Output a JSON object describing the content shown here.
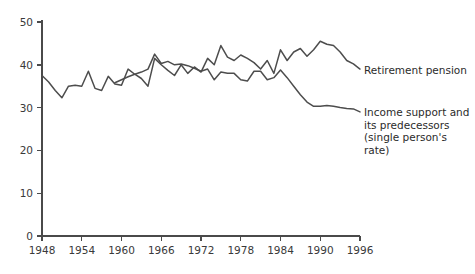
{
  "chart_data": {
    "type": "line",
    "title": "",
    "xlabel": "",
    "ylabel": "",
    "xlim": [
      1948,
      1996
    ],
    "ylim": [
      0,
      50
    ],
    "grid": false,
    "legend_position": "right-inline",
    "x_ticks": [
      1948,
      1954,
      1960,
      1966,
      1972,
      1978,
      1984,
      1990,
      1996
    ],
    "y_ticks": [
      0,
      10,
      20,
      30,
      40,
      50
    ],
    "series": [
      {
        "name": "Retirement pension",
        "x": [
          1948,
          1949,
          1950,
          1951,
          1952,
          1953,
          1954,
          1955,
          1956,
          1957,
          1958,
          1959,
          1960,
          1961,
          1962,
          1963,
          1964,
          1965,
          1966,
          1967,
          1968,
          1969,
          1970,
          1971,
          1972,
          1973,
          1974,
          1975,
          1976,
          1977,
          1978,
          1979,
          1980,
          1981,
          1982,
          1983,
          1984,
          1985,
          1986,
          1987,
          1988,
          1989,
          1990,
          1991,
          1992,
          1993,
          1994,
          1995,
          1996
        ],
        "values": [
          37.5,
          36.0,
          34.0,
          32.3,
          35.0,
          35.2,
          35.0,
          38.5,
          34.5,
          34.0,
          37.3,
          35.5,
          35.2,
          39.0,
          37.8,
          36.8,
          35.0,
          41.5,
          40.0,
          38.7,
          37.5,
          40.0,
          38.0,
          39.5,
          38.3,
          41.5,
          40.0,
          44.5,
          41.8,
          41.0,
          42.3,
          41.5,
          40.5,
          39.0,
          41.0,
          38.0,
          43.5,
          41.0,
          43.0,
          43.8,
          42.0,
          43.5,
          45.5,
          44.8,
          44.5,
          43.0,
          41.0,
          40.2,
          39.0
        ],
        "note": "Starts 1948"
      },
      {
        "name": "Income support and its predecessors (single person's rate)",
        "x": [
          1959,
          1960,
          1961,
          1962,
          1963,
          1964,
          1965,
          1966,
          1967,
          1968,
          1969,
          1970,
          1971,
          1972,
          1973,
          1974,
          1975,
          1976,
          1977,
          1978,
          1979,
          1980,
          1981,
          1982,
          1983,
          1984,
          1985,
          1986,
          1987,
          1988,
          1989,
          1990,
          1991,
          1992,
          1993,
          1994,
          1995,
          1996
        ],
        "values": [
          35.8,
          36.5,
          37.2,
          37.8,
          38.3,
          39.0,
          42.5,
          40.3,
          40.8,
          40.0,
          40.2,
          39.8,
          39.2,
          38.5,
          39.0,
          36.5,
          38.3,
          38.0,
          38.0,
          36.5,
          36.2,
          38.5,
          38.5,
          36.5,
          37.0,
          38.8,
          37.0,
          35.0,
          33.0,
          31.3,
          30.3,
          30.3,
          30.5,
          30.3,
          30.0,
          29.8,
          29.7,
          29.0
        ],
        "note": "Starts 1959"
      }
    ]
  },
  "legend": {
    "retirement_label": "Retirement pension",
    "income_label": "Income support and\nits predecessors\n(single person's rate)"
  },
  "axis": {
    "x_tick_labels": [
      "1948",
      "1954",
      "1960",
      "1966",
      "1972",
      "1978",
      "1984",
      "1990",
      "1996"
    ],
    "y_tick_labels": [
      "0",
      "10",
      "20",
      "30",
      "40",
      "50"
    ]
  },
  "colors": {
    "line": "#4d4d4d",
    "axis": "#4a4a4a",
    "text": "#2b2b2b",
    "background": "#ffffff"
  }
}
